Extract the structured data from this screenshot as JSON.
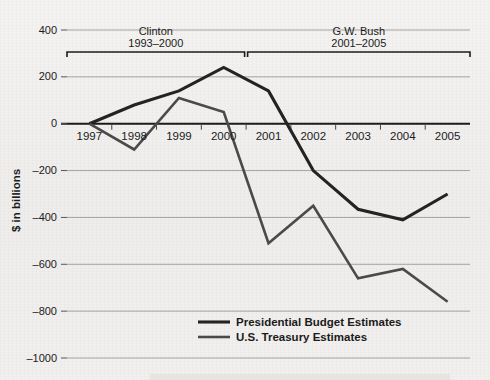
{
  "figure": {
    "background_color": "#f2f1ef",
    "ink_color": "#222222",
    "gridline_color": "#9a9a9a"
  },
  "axis": {
    "y_title": "$ in billions",
    "y_ticks": [
      "400",
      "200",
      "0",
      "-200",
      "-400",
      "-600",
      "-800",
      "-1000"
    ],
    "x_ticks": [
      "1997",
      "1998",
      "1999",
      "2000",
      "2001",
      "2002",
      "2003",
      "2004",
      "2005"
    ]
  },
  "eras": [
    {
      "name": "Clinton",
      "years": "1993-2000"
    },
    {
      "name": "G.W. Bush",
      "years": "2001-2005"
    }
  ],
  "legend": {
    "items": [
      {
        "label": "Presidential Budget Estimates",
        "color": "#232323"
      },
      {
        "label": "U.S. Treasury Estimates",
        "color": "#4a4a4a"
      }
    ]
  },
  "chart_data": {
    "type": "line",
    "title": "",
    "xlabel": "",
    "ylabel": "$ in billions",
    "ylim": [
      -1000,
      400
    ],
    "ytick_step": 200,
    "grid": true,
    "legend_position": "bottom-center",
    "categories": [
      "1997",
      "1998",
      "1999",
      "2000",
      "2001",
      "2002",
      "2003",
      "2004",
      "2005"
    ],
    "series": [
      {
        "name": "Presidential Budget Estimates",
        "color": "#232323",
        "values": [
          0,
          80,
          140,
          240,
          140,
          -200,
          -365,
          -410,
          -300
        ]
      },
      {
        "name": "U.S. Treasury Estimates",
        "color": "#4a4a4a",
        "values": [
          0,
          -110,
          110,
          50,
          -510,
          -350,
          -660,
          -620,
          -760
        ]
      }
    ],
    "annotations": [
      {
        "text": "Clinton 1993-2000",
        "spans": [
          "1997",
          "2000"
        ]
      },
      {
        "text": "G.W. Bush 2001-2005",
        "spans": [
          "2001",
          "2005"
        ]
      }
    ]
  }
}
